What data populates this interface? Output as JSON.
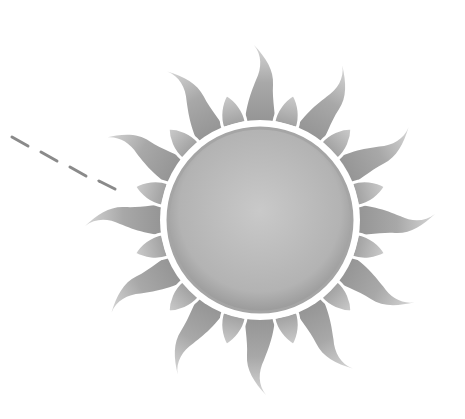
{
  "image": {
    "subject": "sun-illustration",
    "style": "grayscale pencil-shaded clipart",
    "width": 465,
    "height": 419
  },
  "sun": {
    "center": [
      260,
      220
    ],
    "disc_radius": 92,
    "ring_radius": 96,
    "long_ray_count": 12,
    "long_ray_length": 175,
    "short_petal_count": 12,
    "short_petal_length": 130,
    "colors": {
      "disc_light": "#c4c4c4",
      "disc_dark": "#9a9a9a",
      "ray_light": "#bdbdbd",
      "ray_dark": "#8c8c8c",
      "petal_light": "#cfcfcf",
      "petal_dark": "#9e9e9e",
      "gap": "#ffffff"
    }
  },
  "dashed_line": {
    "color": "#8a8a8a",
    "segments": [
      [
        12,
        137,
        28,
        146
      ],
      [
        41,
        152,
        57,
        161
      ],
      [
        70,
        167,
        86,
        176
      ],
      [
        99,
        181,
        115,
        189
      ]
    ]
  }
}
